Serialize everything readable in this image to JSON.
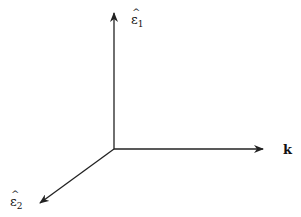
{
  "diagram": {
    "axes": [
      {
        "name": "epsilon-1",
        "label_base": "ε",
        "label_sub": "1",
        "direction": "up"
      },
      {
        "name": "k",
        "label": "k",
        "direction": "right"
      },
      {
        "name": "epsilon-2",
        "label_base": "ε",
        "label_sub": "2",
        "direction": "down-left"
      }
    ],
    "colors": {
      "line": "#222222",
      "background": "#ffffff"
    }
  }
}
